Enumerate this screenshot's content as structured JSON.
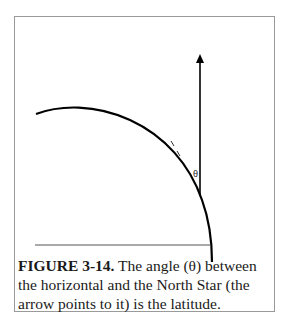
{
  "figure": {
    "label": "FIGURE 3-14.",
    "caption_text": " The angle (θ) between the horizontal and the North Star (the arrow points to it) is the latitude.",
    "angle_symbol": "θ"
  }
}
